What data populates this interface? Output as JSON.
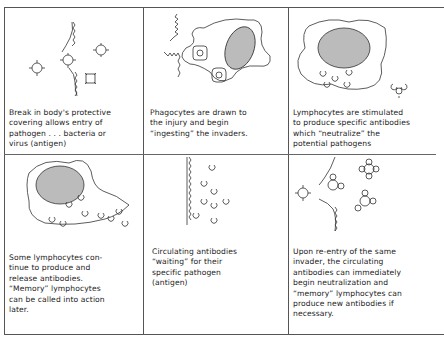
{
  "panels": [
    {
      "id": 1,
      "caption": "Break in body's protective\ncovering allows entry of\npathogen . . . bacteria or\nvirus (antigen)",
      "illustration": "skin-break-with-antigens"
    },
    {
      "id": 2,
      "caption": "Phagocytes are drawn to\nthe injury and begin\n“ingesting” the invaders.",
      "illustration": "phagocyte-ingesting-antigens"
    },
    {
      "id": 3,
      "caption": "Lymphocytes are stimulated\nto produce specific antibodies\nwhich “neutralize” the\npotential pathogens",
      "illustration": "lymphocyte-producing-antibodies"
    },
    {
      "id": 4,
      "caption": "Some lymphocytes con-\ntinue to produce and\nrelease antibodies.\n“Memory” lymphocytes\ncan be called into action\nlater.",
      "illustration": "lymphocyte-releasing-antibodies"
    },
    {
      "id": 5,
      "caption": "Circulating antibodies\n“waiting” for their\nspecific pathogen\n(antigen)",
      "illustration": "circulating-antibodies"
    },
    {
      "id": 6,
      "caption": "Upon re-entry of the same\ninvader, the circulating\nantibodies can immediately\nbegin neutralization and\n“memory” lymphocytes can\nproduce new antibodies if\nnecessary.",
      "illustration": "antibodies-neutralizing-antigens"
    }
  ],
  "colors": {
    "line": "#555555",
    "text": "#222222",
    "background": "#ffffff"
  }
}
